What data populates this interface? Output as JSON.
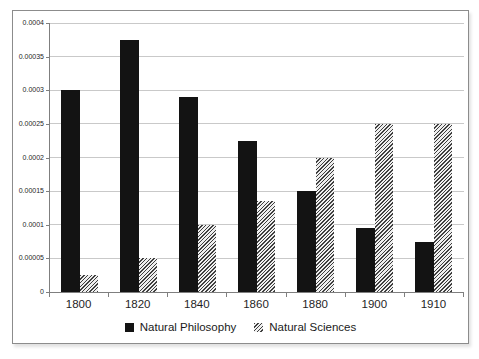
{
  "chart_data": {
    "type": "bar",
    "title": "",
    "xlabel": "",
    "ylabel": "",
    "categories": [
      "1800",
      "1820",
      "1840",
      "1860",
      "1880",
      "1900",
      "1910"
    ],
    "series": [
      {
        "name": "Natural Philosophy",
        "style": "solid-black",
        "color": "#131313",
        "values": [
          0.0003,
          0.000375,
          0.00029,
          0.000225,
          0.00015,
          9.5e-05,
          7.5e-05
        ]
      },
      {
        "name": "Natural Sciences",
        "style": "diagonal-hatch-gray",
        "color": "#3f3f3f",
        "values": [
          2.5e-05,
          5e-05,
          0.0001,
          0.000135,
          0.0002,
          0.00025,
          0.00025
        ]
      }
    ],
    "ylim": [
      0,
      0.0004
    ],
    "ytick_interval": 5e-05,
    "ytick_labels": [
      "0",
      "0.00005",
      "0.0001",
      "0.00015",
      "0.0002",
      "0.00025",
      "0.0003",
      "0.00035",
      "0.0004"
    ],
    "grid": "horizontal",
    "legend_position": "bottom",
    "colors": {
      "gridline": "#c9c9c9",
      "axis": "#7f7f7f",
      "chart_border": "#8c8c8c",
      "text": "#1f1f1f"
    }
  }
}
